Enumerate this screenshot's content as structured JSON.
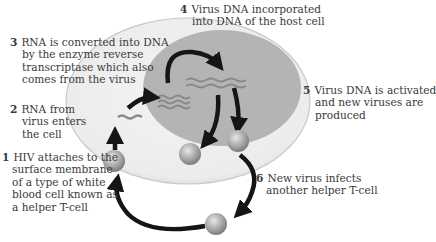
{
  "colors": {
    "outer_cell": "#eeeeee",
    "nucleus": "#b4b4b4",
    "virus": "#a8a8a8",
    "arrow": "#151515",
    "text": "#3a3a3a"
  },
  "steps": [
    {
      "num": "1",
      "lines": [
        "HIV attaches to the",
        "surface membrane",
        "of a type of white",
        "blood cell known as",
        "a helper T-cell"
      ]
    },
    {
      "num": "2",
      "lines": [
        "RNA from",
        "virus enters",
        "the cell"
      ]
    },
    {
      "num": "3",
      "lines": [
        "RNA is converted into DNA",
        "by the enzyme reverse",
        "transcriptase which also",
        "comes from the virus"
      ]
    },
    {
      "num": "4",
      "lines": [
        "Virus DNA incorporated",
        "into DNA of the host cell"
      ]
    },
    {
      "num": "5",
      "lines": [
        "Virus DNA is activated",
        "and new viruses are",
        "produced"
      ]
    },
    {
      "num": "6",
      "lines": [
        "New virus infects",
        "another helper T-cell"
      ]
    }
  ]
}
